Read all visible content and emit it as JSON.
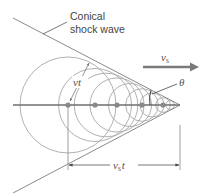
{
  "labels": {
    "shock_line1": "Conical",
    "shock_line2": "shock wave",
    "source_velocity": "v",
    "source_velocity_sub": "s",
    "wave_radius": "vt",
    "angle": "θ",
    "distance": "v",
    "distance_sub": "s",
    "distance_t": "t"
  },
  "colors": {
    "circle": "#a0a0a0",
    "axis": "#707070",
    "dot": "#808080",
    "arrow": "#7a7a7a",
    "cone": "#909090"
  }
}
